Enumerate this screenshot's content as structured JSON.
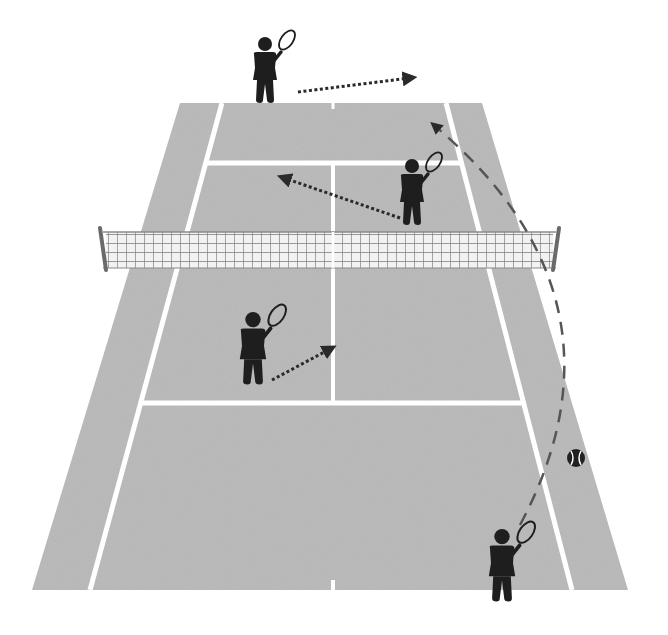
{
  "diagram": {
    "title": "Tennis doubles court positioning diagram",
    "colors": {
      "background": "#ffffff",
      "court": "#bdbdbd",
      "lines": "#ffffff",
      "net_mesh": "#707070",
      "net_fill": "#f2f2f2",
      "post": "#6a6a6a",
      "player": "#1e1e1e",
      "arrow": "#2a2a2a",
      "trajectory": "#555555",
      "ball": "#222222"
    },
    "court": {
      "outer": {
        "top_left": [
          180,
          103
        ],
        "top_right": [
          482,
          103
        ],
        "bottom_right": [
          628,
          590
        ],
        "bottom_left": [
          32,
          590
        ]
      },
      "singles_left": {
        "top": [
          222,
          103
        ],
        "bottom": [
          90,
          590
        ]
      },
      "singles_right": {
        "top": [
          446,
          103
        ],
        "bottom": [
          572,
          590
        ]
      },
      "far_service_line_y": 163,
      "near_service_line_y": 403,
      "center_x": 333
    },
    "net": {
      "y_top": 232,
      "y_bottom": 268,
      "left_post_x": 103,
      "right_post_x": 556
    },
    "players": [
      {
        "id": "far-baseline-player",
        "x": 265,
        "y": 38,
        "scale": 1.0
      },
      {
        "id": "far-net-player",
        "x": 412,
        "y": 160,
        "scale": 1.0
      },
      {
        "id": "near-net-player",
        "x": 253,
        "y": 313,
        "scale": 1.1
      },
      {
        "id": "near-baseline-server",
        "x": 502,
        "y": 530,
        "scale": 1.1
      }
    ],
    "movement_arrows": [
      {
        "id": "far-baseline-move",
        "from": [
          298,
          92
        ],
        "to": [
          410,
          78
        ]
      },
      {
        "id": "far-net-move",
        "from": [
          400,
          218
        ],
        "to": [
          284,
          178
        ]
      },
      {
        "id": "near-net-move",
        "from": [
          272,
          380
        ],
        "to": [
          330,
          349
        ]
      }
    ],
    "ball": {
      "x": 576,
      "y": 458,
      "r": 9
    },
    "ball_trajectory": {
      "from": [
        520,
        525
      ],
      "via": [
        640,
        300
      ],
      "to": [
        435,
        126
      ]
    }
  }
}
